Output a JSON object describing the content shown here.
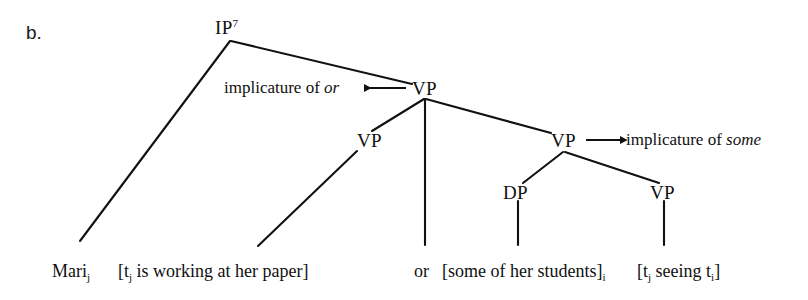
{
  "figure": {
    "item_label": "b."
  },
  "nodes": {
    "ip": {
      "label": "IP",
      "superscript": "7"
    },
    "vp_top": {
      "label": "VP"
    },
    "vp_left": {
      "label": "VP"
    },
    "vp_right": {
      "label": "VP"
    },
    "dp": {
      "label": "DP"
    },
    "vp_inner": {
      "label": "VP"
    }
  },
  "annotations": {
    "or_implicature": {
      "prefix": "implicature of ",
      "italic": "or"
    },
    "some_implicature": {
      "prefix": "implicature of ",
      "italic": "some"
    }
  },
  "leaves": {
    "subject": {
      "text": "Mari",
      "sub": "j"
    },
    "clause1": {
      "open": "[t",
      "sub1": "j",
      "body": " is working at her paper]"
    },
    "conjunction": {
      "text": "or"
    },
    "dp_text": {
      "open": "[some of her students]",
      "sub": "i"
    },
    "vp_text": {
      "open": "[t",
      "sub1": "j",
      "mid": " seeing t",
      "sub2": "i",
      "close": "]"
    }
  },
  "style": {
    "line_color": "#111111",
    "background": "#ffffff"
  }
}
